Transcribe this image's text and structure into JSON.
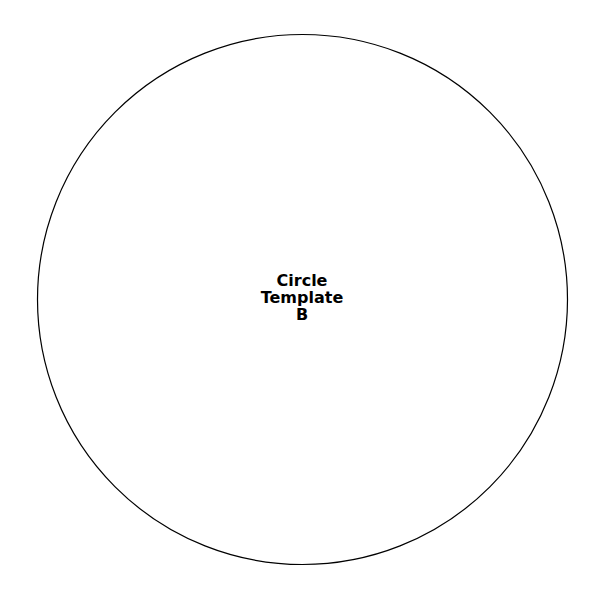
{
  "diagram": {
    "shape": "circle",
    "stroke_color": "#000000",
    "fill_color": "#ffffff",
    "label_lines": [
      "Circle",
      "Template",
      "B"
    ]
  }
}
